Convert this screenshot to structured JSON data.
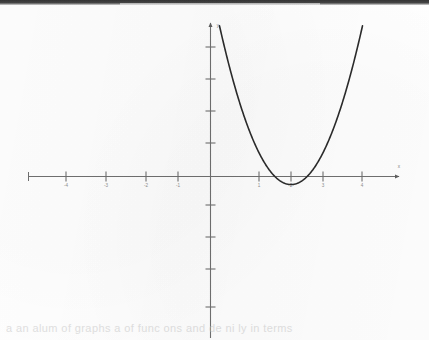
{
  "page": {
    "background_color": "#fefefe",
    "scan_band_color": "#2a2a2a",
    "ghost_text": "a   an alum  of  graphs  a   of func  ons  and de  ni  ly  in  terms"
  },
  "chart_data": {
    "type": "line",
    "title": "",
    "xlabel": "x",
    "ylabel": "y",
    "grid": false,
    "legend": null,
    "xlim": [
      -5.9,
      6.0
    ],
    "ylim": [
      -4.85,
      4.84
    ],
    "x_ticks": [
      -4,
      -3,
      -2,
      -1,
      1,
      2,
      3,
      4
    ],
    "x_tick_labels": [
      "-4",
      "-3",
      "-2",
      "-1",
      "1",
      "2",
      "3",
      "4"
    ],
    "y_ticks": [
      -4,
      -3,
      -2,
      -1,
      1,
      2,
      3,
      4
    ],
    "y_tick_labels": [
      "",
      "",
      "",
      "",
      "",
      "",
      "",
      ""
    ],
    "series": [
      {
        "name": "y = x^2 - 5x + 6",
        "color": "#2b2b2b",
        "equation": "y = (x - 2)(x - 3)",
        "roots": [
          2,
          3
        ],
        "vertex": [
          2.5,
          -0.25
        ],
        "y_intercept": 6,
        "x": [
          0.47,
          0.6,
          0.8,
          1.0,
          1.2,
          1.4,
          1.6,
          1.8,
          2.0,
          2.2,
          2.4,
          2.5,
          2.6,
          2.8,
          3.0,
          3.2,
          3.4,
          3.6,
          3.8,
          4.0,
          4.2,
          4.4,
          4.6,
          4.8,
          5.0,
          5.2,
          5.4,
          5.6,
          5.8
        ],
        "y": [
          3.87,
          3.36,
          2.64,
          2.0,
          1.44,
          0.96,
          0.56,
          0.24,
          0.0,
          -0.16,
          -0.24,
          -0.25,
          -0.24,
          -0.16,
          0.0,
          0.24,
          0.56,
          0.96,
          1.44,
          2.0,
          2.64,
          3.36,
          4.16,
          5.04,
          6.0,
          7.04,
          8.16,
          9.36,
          10.64
        ]
      }
    ]
  },
  "axes": {
    "origin_label": "",
    "x_axis_name": "x-axis",
    "y_axis_name": "y-axis",
    "axis_color": "#6f6f6f",
    "arrowheads": [
      "right",
      "up"
    ]
  }
}
